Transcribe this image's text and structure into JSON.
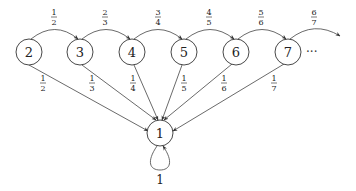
{
  "diagram": {
    "nodes": [
      {
        "id": "n2",
        "label": "2",
        "x": 29,
        "y": 52
      },
      {
        "id": "n3",
        "label": "3",
        "x": 80,
        "y": 52
      },
      {
        "id": "n4",
        "label": "4",
        "x": 132,
        "y": 52
      },
      {
        "id": "n5",
        "label": "5",
        "x": 184,
        "y": 52
      },
      {
        "id": "n6",
        "label": "6",
        "x": 236,
        "y": 52
      },
      {
        "id": "n7",
        "label": "7",
        "x": 288,
        "y": 52
      },
      {
        "id": "n1",
        "label": "1",
        "x": 160,
        "y": 133
      }
    ],
    "node_radius": 13,
    "ellipsis": "···",
    "forward_edges": [
      {
        "from": "2",
        "to": "3",
        "num": "1",
        "den": "2"
      },
      {
        "from": "3",
        "to": "4",
        "num": "2",
        "den": "3"
      },
      {
        "from": "4",
        "to": "5",
        "num": "3",
        "den": "4"
      },
      {
        "from": "5",
        "to": "6",
        "num": "4",
        "den": "5"
      },
      {
        "from": "6",
        "to": "7",
        "num": "5",
        "den": "6"
      },
      {
        "from": "7",
        "to": "…",
        "num": "6",
        "den": "7"
      }
    ],
    "down_edges": [
      {
        "from": "2",
        "to": "1",
        "num": "1",
        "den": "2"
      },
      {
        "from": "3",
        "to": "1",
        "num": "1",
        "den": "3"
      },
      {
        "from": "4",
        "to": "1",
        "num": "1",
        "den": "4"
      },
      {
        "from": "5",
        "to": "1",
        "num": "1",
        "den": "5"
      },
      {
        "from": "6",
        "to": "1",
        "num": "1",
        "den": "6"
      },
      {
        "from": "7",
        "to": "1",
        "num": "1",
        "den": "7"
      }
    ],
    "self_loop": {
      "node": "1",
      "label": "1"
    },
    "colors": {
      "stroke": "#444444",
      "text": "#222222",
      "background": "#ffffff"
    }
  }
}
